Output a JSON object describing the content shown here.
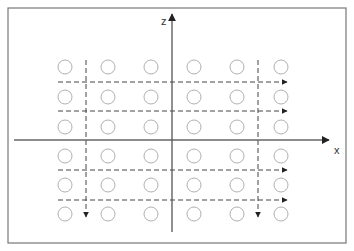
{
  "diagram": {
    "frame": {
      "x": 8,
      "y": 8,
      "width": 338,
      "height": 235,
      "stroke": "#777777"
    },
    "axes": {
      "x_axis": {
        "label": "x",
        "y": 140,
        "x_start": 14,
        "x_end": 329,
        "color": "#666666"
      },
      "z_axis": {
        "label": "z",
        "x": 172,
        "y_start": 232,
        "y_end": 14,
        "color": "#555555"
      }
    },
    "grid": {
      "columns_x": [
        65,
        108,
        151,
        194,
        237,
        281
      ],
      "rows_y": [
        67,
        97,
        127,
        156,
        185,
        214
      ],
      "circle_radius": 7,
      "circle_stroke": "#b0b0b0"
    },
    "scan_lines": {
      "horizontal": [
        {
          "y": 82,
          "x_start": 58,
          "x_end": 287
        },
        {
          "y": 111,
          "x_start": 58,
          "x_end": 287
        },
        {
          "y": 170,
          "x_start": 58,
          "x_end": 287
        },
        {
          "y": 200,
          "x_start": 58,
          "x_end": 287
        }
      ],
      "vertical": [
        {
          "x": 86,
          "y_start": 60,
          "y_end": 217
        },
        {
          "x": 258,
          "y_start": 60,
          "y_end": 217
        }
      ],
      "color": "#444444",
      "dash": "5,3"
    }
  }
}
